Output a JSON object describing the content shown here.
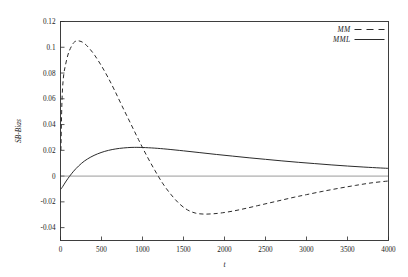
{
  "chart_data": {
    "type": "line",
    "title": "",
    "xlabel": "t",
    "ylabel": "SB-Bias",
    "xlim": [
      0,
      4000
    ],
    "ylim": [
      -0.05,
      0.12
    ],
    "grid": false,
    "zero_line": true,
    "legend_position": "top-right",
    "xticks": [
      0,
      500,
      1000,
      1500,
      2000,
      2500,
      3000,
      3500,
      4000
    ],
    "xtick_labels": [
      "0",
      "500",
      "1000",
      "1500",
      "2000",
      "2500",
      "3000",
      "3500",
      "4000"
    ],
    "yticks": [
      0.12,
      0.1,
      0.08,
      0.06,
      0.04,
      0.02,
      0,
      -0.02,
      -0.04
    ],
    "ytick_labels": [
      "0.12",
      "0.1",
      "0.08",
      "0.06",
      "0.04",
      "0.02",
      "0",
      "-0.02",
      "-0.04"
    ],
    "colors": {
      "line": "#2b2b2b",
      "zero_line": "#8e8e8e",
      "frame": "#2b2b2b",
      "background": "#ffffff"
    },
    "series": [
      {
        "name": "MM",
        "style": "dashed",
        "x": [
          5,
          15,
          25,
          40,
          60,
          90,
          120,
          160,
          200,
          250,
          300,
          360,
          420,
          500,
          580,
          660,
          750,
          850,
          950,
          1050,
          1150,
          1250,
          1350,
          1450,
          1550,
          1650,
          1750,
          1850,
          1950,
          2100,
          2250,
          2400,
          2550,
          2700,
          2850,
          3000,
          3200,
          3400,
          3600,
          3800,
          4000
        ],
        "y": [
          0.02,
          0.052,
          0.068,
          0.079,
          0.086,
          0.094,
          0.099,
          0.1035,
          0.105,
          0.1045,
          0.1025,
          0.0985,
          0.0935,
          0.0855,
          0.0765,
          0.0665,
          0.0545,
          0.0415,
          0.0285,
          0.016,
          0.0045,
          -0.006,
          -0.0145,
          -0.0215,
          -0.0263,
          -0.0288,
          -0.0295,
          -0.0293,
          -0.0287,
          -0.0272,
          -0.0252,
          -0.023,
          -0.0208,
          -0.0186,
          -0.0164,
          -0.0144,
          -0.0118,
          -0.0094,
          -0.0072,
          -0.0052,
          -0.0038
        ]
      },
      {
        "name": "MML",
        "style": "solid",
        "x": [
          5,
          20,
          40,
          70,
          110,
          160,
          220,
          290,
          370,
          450,
          540,
          630,
          720,
          820,
          900,
          1000,
          1150,
          1300,
          1500,
          1700,
          1900,
          2100,
          2300,
          2500,
          2700,
          2900,
          3100,
          3300,
          3500,
          3700,
          3900,
          4000
        ],
        "y": [
          -0.0102,
          -0.0088,
          -0.0068,
          -0.0038,
          -0.0002,
          0.0038,
          0.0078,
          0.0116,
          0.0148,
          0.0172,
          0.0192,
          0.0206,
          0.0215,
          0.0221,
          0.0223,
          0.0222,
          0.0217,
          0.0209,
          0.0196,
          0.0182,
          0.0168,
          0.0155,
          0.0142,
          0.013,
          0.0118,
          0.0107,
          0.0097,
          0.0087,
          0.0078,
          0.007,
          0.0063,
          0.006
        ]
      }
    ],
    "legend": [
      {
        "label": "MM",
        "style": "dashed"
      },
      {
        "label": "MML",
        "style": "solid"
      }
    ]
  }
}
